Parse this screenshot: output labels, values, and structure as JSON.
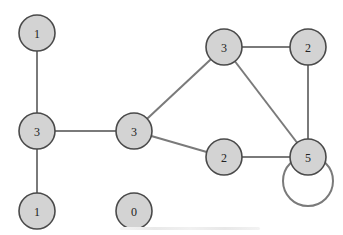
{
  "diagram": {
    "type": "undirected-graph",
    "node_label_meaning": "degree",
    "style": {
      "node_fill": "#d3d3d3",
      "node_stroke": "#4a4a4a",
      "edge_color": "#7a7a7a",
      "background": "#ffffff",
      "node_radius": 18
    },
    "nodes": [
      {
        "id": "n1",
        "label": "1",
        "x": 37,
        "y": 33
      },
      {
        "id": "n2",
        "label": "3",
        "x": 37,
        "y": 131
      },
      {
        "id": "n3",
        "label": "1",
        "x": 37,
        "y": 211
      },
      {
        "id": "n4",
        "label": "3",
        "x": 134,
        "y": 131
      },
      {
        "id": "n5",
        "label": "0",
        "x": 134,
        "y": 211
      },
      {
        "id": "n6",
        "label": "3",
        "x": 224,
        "y": 47
      },
      {
        "id": "n7",
        "label": "2",
        "x": 308,
        "y": 47
      },
      {
        "id": "n8",
        "label": "2",
        "x": 224,
        "y": 157
      },
      {
        "id": "n9",
        "label": "5",
        "x": 308,
        "y": 157
      }
    ],
    "edges": [
      {
        "from": "n1",
        "to": "n2"
      },
      {
        "from": "n2",
        "to": "n3"
      },
      {
        "from": "n2",
        "to": "n4"
      },
      {
        "from": "n4",
        "to": "n6"
      },
      {
        "from": "n4",
        "to": "n8"
      },
      {
        "from": "n6",
        "to": "n7"
      },
      {
        "from": "n6",
        "to": "n9"
      },
      {
        "from": "n7",
        "to": "n9"
      },
      {
        "from": "n8",
        "to": "n9"
      }
    ],
    "self_loops": [
      {
        "node": "n9",
        "cx": 308,
        "cy": 181,
        "r": 25
      }
    ],
    "caption": ""
  }
}
